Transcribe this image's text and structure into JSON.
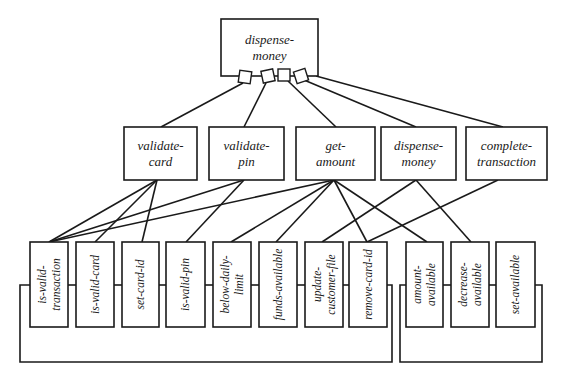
{
  "diagram": {
    "type": "structure-chart",
    "root": {
      "id": "root",
      "lines": [
        "dispense-",
        "money"
      ],
      "x": 221,
      "y": 19,
      "w": 97,
      "h": 57
    },
    "connectors": [
      {
        "id": "c1",
        "cx": 245,
        "cy": 77,
        "rot": 8
      },
      {
        "id": "c2",
        "cx": 268,
        "cy": 76,
        "rot": -12
      },
      {
        "id": "c3",
        "cx": 284,
        "cy": 75,
        "rot": 0
      },
      {
        "id": "c4",
        "cx": 301,
        "cy": 76,
        "rot": -18
      }
    ],
    "middle": [
      {
        "id": "validate-card",
        "lines": [
          "validate-",
          "card"
        ],
        "x": 124,
        "y": 127,
        "w": 73,
        "h": 53
      },
      {
        "id": "validate-pin",
        "lines": [
          "validate-",
          "pin"
        ],
        "x": 209,
        "y": 127,
        "w": 75,
        "h": 53
      },
      {
        "id": "get-amount",
        "lines": [
          "get-",
          "amount"
        ],
        "x": 296,
        "y": 127,
        "w": 79,
        "h": 53
      },
      {
        "id": "dispense-money-2",
        "lines": [
          "dispense-",
          "money"
        ],
        "x": 381,
        "y": 127,
        "w": 75,
        "h": 53
      },
      {
        "id": "complete-transaction",
        "lines": [
          "complete-",
          "transaction"
        ],
        "x": 466,
        "y": 127,
        "w": 81,
        "h": 53
      }
    ],
    "bottom": [
      {
        "id": "is-valid-transaction",
        "lines": [
          "is-valid-",
          "transaction"
        ],
        "x": 30,
        "y": 242,
        "w": 38,
        "h": 85
      },
      {
        "id": "is-valid-card",
        "lines": [
          "is-valid-card"
        ],
        "x": 76,
        "y": 242,
        "w": 38,
        "h": 85
      },
      {
        "id": "set-card-id",
        "lines": [
          "set-card-id"
        ],
        "x": 122,
        "y": 242,
        "w": 37,
        "h": 85
      },
      {
        "id": "is-valid-pin",
        "lines": [
          "is-valid-pin"
        ],
        "x": 166,
        "y": 242,
        "w": 39,
        "h": 85
      },
      {
        "id": "below-daily-limit",
        "lines": [
          "below-daily-",
          "limit"
        ],
        "x": 213,
        "y": 242,
        "w": 38,
        "h": 85
      },
      {
        "id": "funds-available",
        "lines": [
          "funds-available"
        ],
        "x": 259,
        "y": 242,
        "w": 38,
        "h": 85
      },
      {
        "id": "update-customer-file",
        "lines": [
          "update-",
          "customer-file"
        ],
        "x": 305,
        "y": 242,
        "w": 38,
        "h": 85
      },
      {
        "id": "remove-card-id",
        "lines": [
          "remove-card-id"
        ],
        "x": 349,
        "y": 242,
        "w": 38,
        "h": 85
      },
      {
        "id": "amount-available",
        "lines": [
          "amount-",
          "available"
        ],
        "x": 406,
        "y": 242,
        "w": 37,
        "h": 85
      },
      {
        "id": "decrease-available",
        "lines": [
          "decrease-",
          "available"
        ],
        "x": 451,
        "y": 242,
        "w": 38,
        "h": 85
      },
      {
        "id": "set-available",
        "lines": [
          "set-available"
        ],
        "x": 496,
        "y": 242,
        "w": 39,
        "h": 85
      }
    ],
    "top_edges": [
      {
        "from": "c1",
        "to": "validate-card",
        "x1": 243,
        "y1": 83,
        "x2": 161,
        "y2": 127
      },
      {
        "from": "c2",
        "to": "validate-pin",
        "x1": 266,
        "y1": 83,
        "x2": 244,
        "y2": 127
      },
      {
        "from": "c3",
        "to": "get-amount",
        "x1": 288,
        "y1": 81,
        "x2": 336,
        "y2": 127
      },
      {
        "from": "c4",
        "to": "dispense-money-2",
        "x1": 304,
        "y1": 80,
        "x2": 416,
        "y2": 127
      },
      {
        "from": "root",
        "to": "complete-transaction",
        "x1": 316,
        "y1": 76,
        "x2": 503,
        "y2": 127
      }
    ],
    "bottom_edges": [
      {
        "from": "validate-card",
        "to": "is-valid-transaction",
        "x1": 157,
        "y1": 180,
        "x2": 49,
        "y2": 242
      },
      {
        "from": "validate-card",
        "to": "is-valid-card",
        "x1": 157,
        "y1": 180,
        "x2": 95,
        "y2": 242
      },
      {
        "from": "validate-card",
        "to": "set-card-id",
        "x1": 157,
        "y1": 180,
        "x2": 142,
        "y2": 242
      },
      {
        "from": "validate-pin",
        "to": "is-valid-transaction",
        "x1": 244,
        "y1": 180,
        "x2": 49,
        "y2": 242
      },
      {
        "from": "validate-pin",
        "to": "is-valid-pin",
        "x1": 244,
        "y1": 180,
        "x2": 186,
        "y2": 242
      },
      {
        "from": "get-amount",
        "to": "is-valid-transaction",
        "x1": 334,
        "y1": 180,
        "x2": 49,
        "y2": 242
      },
      {
        "from": "get-amount",
        "to": "below-daily-limit",
        "x1": 334,
        "y1": 180,
        "x2": 231,
        "y2": 242
      },
      {
        "from": "get-amount",
        "to": "funds-available",
        "x1": 334,
        "y1": 180,
        "x2": 276,
        "y2": 242
      },
      {
        "from": "get-amount",
        "to": "remove-card-id",
        "x1": 334,
        "y1": 180,
        "x2": 367,
        "y2": 242
      },
      {
        "from": "get-amount",
        "to": "amount-available",
        "x1": 334,
        "y1": 180,
        "x2": 427,
        "y2": 242
      },
      {
        "from": "dispense-money-2",
        "to": "update-customer-file",
        "x1": 416,
        "y1": 180,
        "x2": 322,
        "y2": 242
      },
      {
        "from": "dispense-money-2",
        "to": "decrease-available",
        "x1": 416,
        "y1": 180,
        "x2": 471,
        "y2": 242
      },
      {
        "from": "complete-transaction",
        "to": "remove-card-id",
        "x1": 498,
        "y1": 180,
        "x2": 367,
        "y2": 242
      }
    ],
    "groups": [
      {
        "id": "left-bracket",
        "points": "30,285 20,285 20,362 392,362 392,285 387,285"
      },
      {
        "id": "right-bracket",
        "points": "406,285 400,285 400,362 542,362 542,285 535,285"
      }
    ],
    "bus_segments": [
      {
        "x1": 68,
        "x2": 76
      },
      {
        "x1": 114,
        "x2": 122
      },
      {
        "x1": 159,
        "x2": 166
      },
      {
        "x1": 205,
        "x2": 213
      },
      {
        "x1": 251,
        "x2": 259
      },
      {
        "x1": 297,
        "x2": 305
      },
      {
        "x1": 343,
        "x2": 349
      },
      {
        "x1": 443,
        "x2": 451
      },
      {
        "x1": 489,
        "x2": 496
      }
    ],
    "bus_y": 285
  }
}
